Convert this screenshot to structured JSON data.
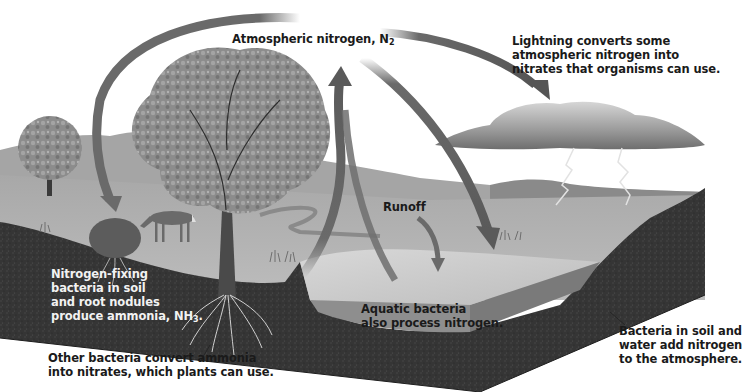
{
  "diagram": {
    "topic": "Nitrogen cycle",
    "colors": {
      "background": "#ffffff",
      "sky": "#f4f4f4",
      "hills": "#9a9a9a",
      "grass": "#b5b5b5",
      "soil": "#3a3a3a",
      "water_surface": "#c9c9c9",
      "water_front": "#8e8e8e",
      "arrow": "#6a6a6a",
      "cloud": "#8a8a8a",
      "tree_foliage": "#8f8f8f",
      "text_dark": "#1a1a1a",
      "text_light": "#f2f2f2"
    },
    "labels": {
      "atmospheric_nitrogen": "Atmospheric nitrogen, N",
      "atmospheric_nitrogen_sub": "2",
      "lightning": "Lightning converts some\natmospheric nitrogen into\nnitrates that organisms can use.",
      "runoff": "Runoff",
      "nitrogen_fixing": "Nitrogen-fixing\nbacteria in soil\nand root nodules\nproduce ammonia, NH",
      "nitrogen_fixing_sub": "3",
      "nitrogen_fixing_end": ".",
      "aquatic_bacteria": "Aquatic bacteria\nalso process nitrogen.",
      "other_bacteria": "Other bacteria convert ammonia\ninto nitrates, which plants can use.",
      "soil_water_bacteria": "Bacteria in soil and\nwater add nitrogen\nto the atmosphere."
    },
    "elements": {
      "arrows": [
        "atmosphere-to-plants-arrow",
        "atmosphere-to-lightning-arrow",
        "soil-to-atmosphere-arrow",
        "atmosphere-to-water-arrow",
        "runoff-arrow"
      ],
      "icons": [
        "oak-tree",
        "small-tree",
        "deer",
        "shrub",
        "storm-cloud",
        "lightning-bolt",
        "roots",
        "pond",
        "soil-block"
      ]
    }
  }
}
